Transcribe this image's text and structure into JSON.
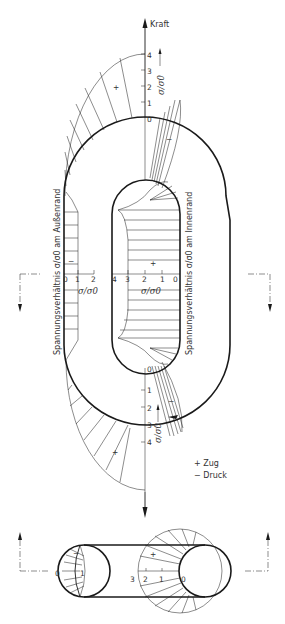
{
  "figure": {
    "type": "chain-link-stress-distribution",
    "force_label": "Kraft",
    "ratio_symbol": "σ/σ0",
    "outer_edge_label": "Spannungsverhältnis σ/σ0 am Außenrand",
    "inner_edge_label": "Spannungsverhältnis σ/σ0 am Innenrand",
    "legend": {
      "plus_label": "+ Zug",
      "minus_label": "− Druck"
    },
    "signs": {
      "plus": "+",
      "minus": "−"
    },
    "top_axis": {
      "ticks": [
        "4",
        "3",
        "2",
        "1",
        "0"
      ],
      "label": "σ/σ0"
    },
    "bottom_axis": {
      "ticks": [
        "0",
        "1",
        "2",
        "3",
        "4"
      ],
      "label": "σ/σ0"
    },
    "outer_side_axis": {
      "ticks": [
        "0",
        "1",
        "2"
      ],
      "label": "σ/σ0"
    },
    "inner_side_axis": {
      "ticks": [
        "4",
        "3",
        "2",
        "1",
        "0"
      ],
      "label": "σ/σ0"
    },
    "cross_section": {
      "left_ticks": [
        "0",
        "1"
      ],
      "right_ticks": [
        "3",
        "2",
        "1",
        "0"
      ]
    }
  },
  "colors": {
    "line": "#1a1a1a",
    "text": "#333333",
    "background": "#ffffff"
  }
}
